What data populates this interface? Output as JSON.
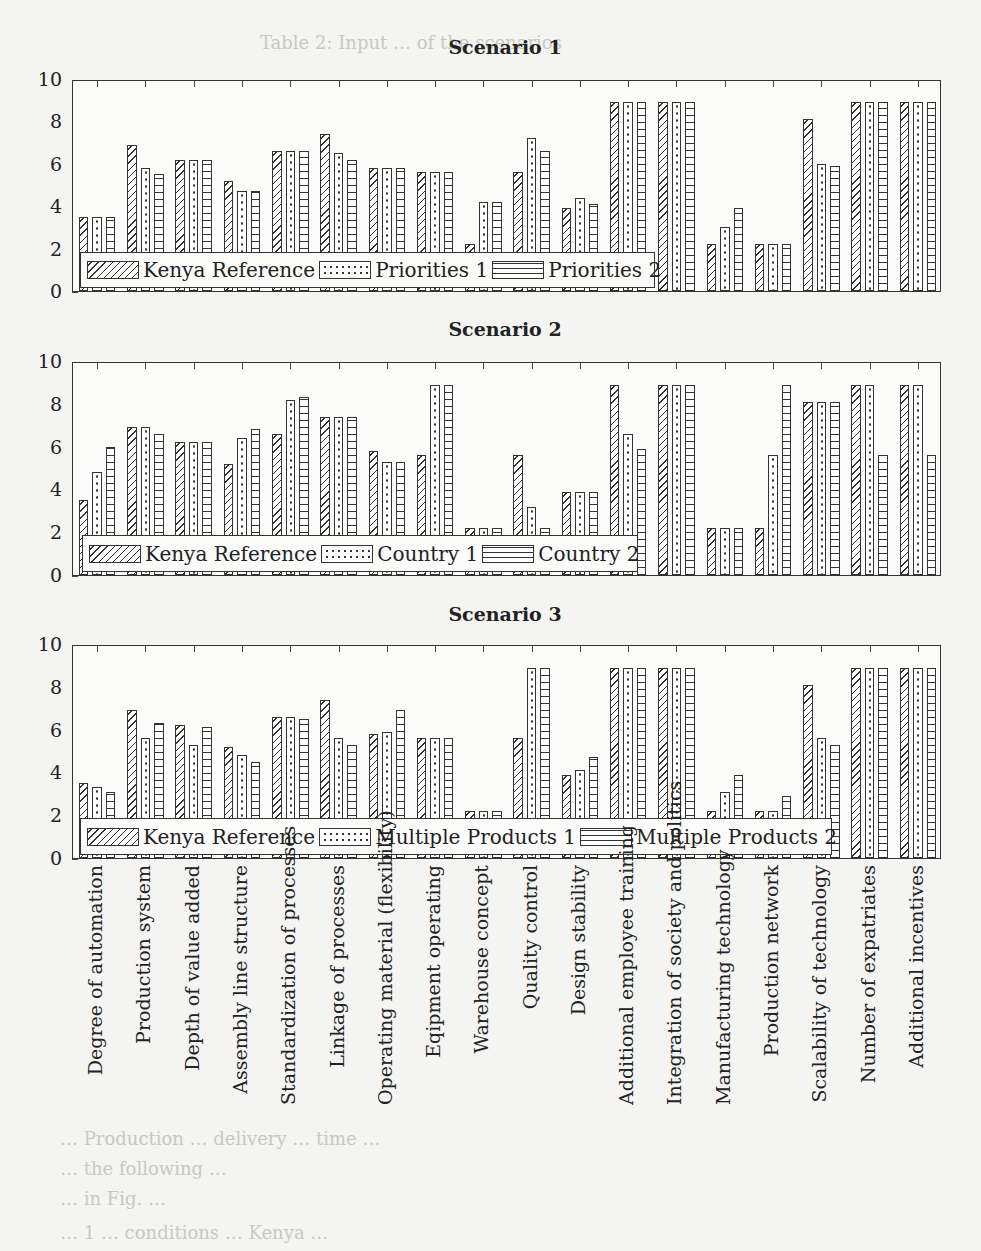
{
  "chart_data": [
    {
      "type": "bar",
      "title": "Scenario 1",
      "xlabel": "",
      "ylabel": "",
      "ylim": [
        0,
        10
      ],
      "yticks": [
        0,
        2,
        4,
        6,
        8,
        10
      ],
      "grid": false,
      "legend_position": "bottom-left inside",
      "categories": [
        "Degree of automation",
        "Production system",
        "Depth of value added",
        "Assembly line structure",
        "Standardization of processes",
        "Linkage of processes",
        "Operating material (flexibility)",
        "Eqipment operating",
        "Warehouse concept",
        "Quality control",
        "Design stability",
        "Additional employee training",
        "Integration of society and politics",
        "Manufacturing technology",
        "Production network",
        "Scalability of technology",
        "Number of expatriates",
        "Additional incentives"
      ],
      "series": [
        {
          "name": "Kenya Reference",
          "pattern": "hatch",
          "values": [
            3.5,
            6.9,
            6.2,
            5.2,
            6.6,
            7.4,
            5.8,
            5.6,
            2.2,
            5.6,
            3.9,
            8.9,
            8.9,
            2.2,
            2.2,
            8.1,
            8.9,
            8.9
          ]
        },
        {
          "name": "Priorities 1",
          "pattern": "dots",
          "values": [
            3.5,
            5.8,
            6.2,
            4.7,
            6.6,
            6.5,
            5.8,
            5.6,
            4.2,
            7.2,
            4.4,
            8.9,
            8.9,
            3.0,
            2.2,
            6.0,
            8.9,
            8.9
          ]
        },
        {
          "name": "Priorities 2",
          "pattern": "hlines",
          "values": [
            3.5,
            5.5,
            6.2,
            4.7,
            6.6,
            6.2,
            5.8,
            5.6,
            4.2,
            6.6,
            4.1,
            8.9,
            8.9,
            3.9,
            2.2,
            5.9,
            8.9,
            8.9
          ]
        }
      ]
    },
    {
      "type": "bar",
      "title": "Scenario 2",
      "xlabel": "",
      "ylabel": "",
      "ylim": [
        0,
        10
      ],
      "yticks": [
        0,
        2,
        4,
        6,
        8,
        10
      ],
      "grid": false,
      "legend_position": "bottom-left inside",
      "categories": [
        "Degree of automation",
        "Production system",
        "Depth of value added",
        "Assembly line structure",
        "Standardization of processes",
        "Linkage of processes",
        "Operating material (flexibility)",
        "Eqipment operating",
        "Warehouse concept",
        "Quality control",
        "Design stability",
        "Additional employee training",
        "Integration of society and politics",
        "Manufacturing technology",
        "Production network",
        "Scalability of technology",
        "Number of expatriates",
        "Additional incentives"
      ],
      "series": [
        {
          "name": "Kenya Reference",
          "pattern": "hatch",
          "values": [
            3.5,
            6.9,
            6.2,
            5.2,
            6.6,
            7.4,
            5.8,
            5.6,
            2.2,
            5.6,
            3.9,
            8.9,
            8.9,
            2.2,
            2.2,
            8.1,
            8.9,
            8.9
          ]
        },
        {
          "name": "Country 1",
          "pattern": "dots",
          "values": [
            4.8,
            6.9,
            6.2,
            6.4,
            8.2,
            7.4,
            5.3,
            8.9,
            2.2,
            3.2,
            3.9,
            6.6,
            8.9,
            2.2,
            5.6,
            8.1,
            8.9,
            8.9
          ]
        },
        {
          "name": "Country 2",
          "pattern": "hlines",
          "values": [
            6.0,
            6.6,
            6.2,
            6.8,
            8.3,
            7.4,
            5.3,
            8.9,
            2.2,
            2.2,
            3.9,
            5.9,
            8.9,
            2.2,
            8.9,
            8.1,
            5.6,
            5.6
          ]
        }
      ]
    },
    {
      "type": "bar",
      "title": "Scenario 3",
      "xlabel": "",
      "ylabel": "",
      "ylim": [
        0,
        10
      ],
      "yticks": [
        0,
        2,
        4,
        6,
        8,
        10
      ],
      "grid": false,
      "legend_position": "bottom-left inside",
      "categories": [
        "Degree of automation",
        "Production system",
        "Depth of value added",
        "Assembly line structure",
        "Standardization of processes",
        "Linkage of processes",
        "Operating material (flexibility)",
        "Eqipment operating",
        "Warehouse concept",
        "Quality control",
        "Design stability",
        "Additional employee training",
        "Integration of society and politics",
        "Manufacturing technology",
        "Production network",
        "Scalability of technology",
        "Number of expatriates",
        "Additional incentives"
      ],
      "series": [
        {
          "name": "Kenya Reference",
          "pattern": "hatch",
          "values": [
            3.5,
            6.9,
            6.2,
            5.2,
            6.6,
            7.4,
            5.8,
            5.6,
            2.2,
            5.6,
            3.9,
            8.9,
            8.9,
            2.2,
            2.2,
            8.1,
            8.9,
            8.9
          ]
        },
        {
          "name": "Multiple Products 1",
          "pattern": "dots",
          "values": [
            3.3,
            5.6,
            5.3,
            4.8,
            6.6,
            5.6,
            5.9,
            5.6,
            2.2,
            8.9,
            4.1,
            8.9,
            8.9,
            3.1,
            2.2,
            5.6,
            8.9,
            8.9
          ]
        },
        {
          "name": "Multiple Products 2",
          "pattern": "hlines",
          "values": [
            3.1,
            6.3,
            6.1,
            4.5,
            6.5,
            5.3,
            6.9,
            5.6,
            2.2,
            8.9,
            4.7,
            8.9,
            8.9,
            3.9,
            2.9,
            5.3,
            8.9,
            8.9
          ]
        }
      ]
    }
  ],
  "xlabels": [
    "Degree of automation",
    "Production system",
    "Depth of value added",
    "Assembly line structure",
    "Standardization of processes",
    "Linkage of processes",
    "Operating material (flexibility)",
    "Eqipment operating",
    "Warehouse concept",
    "Quality control",
    "Design stability",
    "Additional employee training",
    "Integration of society and politics",
    "Manufacturing technology",
    "Production network",
    "Scalability of technology",
    "Number of expatriates",
    "Additional incentives"
  ],
  "background_text": {
    "top": "Table 2: Input … of the scenarios",
    "bottom_lines": [
      "… Production … delivery … time …",
      "… the following …",
      "… in Fig. …",
      "… 1 … conditions … Kenya …"
    ]
  }
}
